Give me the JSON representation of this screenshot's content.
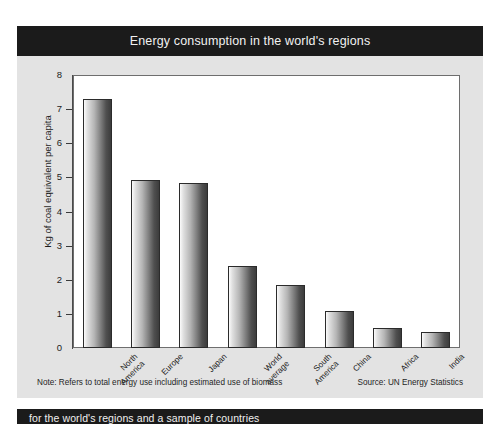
{
  "title": {
    "text": "Energy consumption in the world's regions"
  },
  "footer": {
    "note": "Note: Refers to total energy use including estimated use of biomass",
    "source": "Source: UN Energy Statistics"
  },
  "caption": {
    "text": "for the world's regions and a sample of countries"
  },
  "colors": {
    "title_band": "#1b1b1b",
    "title_text": "#f2f2f2",
    "card_background": "#e3e3e3",
    "plot_background": "#ffffff",
    "bar_light": "#fbfbfb",
    "bar_dark": "#3c3c3c",
    "axis": "#4a4a4a"
  },
  "chart_data": {
    "type": "bar",
    "title": "Energy consumption in the world's regions",
    "xlabel": "",
    "ylabel": "Kg of coal equivalent per capita",
    "categories": [
      "North\nAmerica",
      "Europe",
      "Japan",
      "World\naverage",
      "South\nAmerica",
      "China",
      "Africa",
      "India"
    ],
    "values": [
      7.3,
      4.92,
      4.85,
      2.4,
      1.85,
      1.08,
      0.58,
      0.48
    ],
    "ylim": [
      0,
      8
    ],
    "yticks": [
      0,
      1,
      2,
      3,
      4,
      5,
      6,
      7,
      8
    ],
    "ytick_labels": [
      "0",
      "1",
      "2",
      "3",
      "4",
      "5",
      "6",
      "7",
      "8"
    ],
    "grid": false,
    "legend": "none",
    "annotations": [
      "Note: Refers to total energy use including estimated use of biomass",
      "Source: UN Energy Statistics"
    ]
  }
}
